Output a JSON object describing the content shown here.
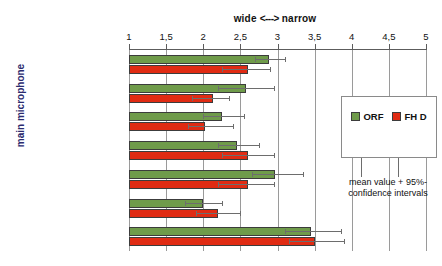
{
  "chart_data": {
    "type": "bar",
    "orientation": "horizontal",
    "title": "wide  <--->  narrow",
    "title_left": "wide",
    "title_arrow": "<--->",
    "title_right": "narrow",
    "ylabel": "main microphone",
    "xlabel": "",
    "xlim": [
      1,
      5
    ],
    "xticks": [
      1,
      1.5,
      2,
      2.5,
      3,
      3.5,
      4,
      4.5,
      5
    ],
    "xticklabels": [
      "1",
      "1,5",
      "2",
      "2,5",
      "3",
      "3,5",
      "4",
      "4,5",
      "5"
    ],
    "grid": true,
    "grid_axis": "x",
    "legend_position": "right-inside-box",
    "annotation": "mean value + 95%-confidence intervals",
    "annotation_line1": "mean value + 95%-",
    "annotation_line2": "confidence intervals",
    "categories": [
      "Stereo+C + NHK (A)",
      "Decca (B)",
      "OCT + NHK (C)",
      "Brauner/ INA 5 (D)",
      "KFM (E)",
      "OCT Surround (F)",
      "Soundfield (G)"
    ],
    "series": [
      {
        "name": "ORF",
        "color": "#6f9b4a",
        "values": [
          2.88,
          2.58,
          2.25,
          2.45,
          2.97,
          2.0,
          3.45
        ],
        "ci_low": [
          2.7,
          2.2,
          2.0,
          2.2,
          2.65,
          1.75,
          3.1
        ],
        "ci_high": [
          3.1,
          2.95,
          2.55,
          2.75,
          3.35,
          2.25,
          3.85
        ]
      },
      {
        "name": "FH D",
        "color": "#e02b13",
        "values": [
          2.6,
          2.13,
          2.02,
          2.6,
          2.6,
          2.2,
          3.5
        ],
        "ci_low": [
          2.25,
          1.85,
          1.8,
          2.25,
          2.2,
          1.9,
          3.15
        ],
        "ci_high": [
          2.9,
          2.35,
          2.4,
          2.95,
          2.95,
          2.5,
          3.9
        ]
      }
    ]
  },
  "legend": {
    "items": [
      {
        "label": "ORF",
        "color": "#6f9b4a"
      },
      {
        "label": "FH D",
        "color": "#e02b13"
      }
    ],
    "note_line1": "mean value + 95%-",
    "note_line2": "confidence intervals"
  },
  "colors": {
    "orf": "#6f9b4a",
    "fhd": "#e02b13",
    "axis": "#5c5c5c",
    "grid": "#9a9a9a",
    "ylabel": "#2b2b6f"
  }
}
